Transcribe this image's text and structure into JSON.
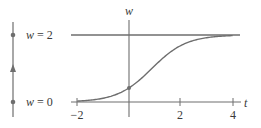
{
  "figure": {
    "phase_line": {
      "equilibria": [
        {
          "label_var": "w",
          "label_eq": " = ",
          "label_val": "2",
          "value": 2,
          "type": "sink"
        },
        {
          "label_var": "w",
          "label_eq": " = ",
          "label_val": "0",
          "value": 0,
          "type": "source"
        }
      ],
      "arrow_direction": "up"
    },
    "axes": {
      "x_label": "t",
      "y_label": "w",
      "x_ticks": [
        {
          "value": -2,
          "label": "−2"
        },
        {
          "value": 2,
          "label": "2"
        },
        {
          "value": 4,
          "label": "4"
        }
      ]
    },
    "colors": {
      "line": "#6e6e6e",
      "curve": "#6e6e6e",
      "text": "#3a3a3a"
    }
  },
  "chart_data": {
    "type": "line",
    "title": "",
    "xlabel": "t",
    "ylabel": "w",
    "xlim": [
      -2,
      4
    ],
    "ylim": [
      0,
      2
    ],
    "x_ticks": [
      -2,
      2,
      4
    ],
    "grid": false,
    "series": [
      {
        "name": "solution w(t)",
        "x": [
          -2,
          -1.5,
          -1,
          -0.5,
          0,
          0.5,
          1,
          1.5,
          2,
          2.5,
          3,
          3.5,
          4
        ],
        "values": [
          0.03,
          0.06,
          0.11,
          0.23,
          0.42,
          0.74,
          1.09,
          1.41,
          1.68,
          1.84,
          1.92,
          1.96,
          1.98
        ]
      },
      {
        "name": "equilibrium w = 2",
        "x": [
          -2,
          4
        ],
        "values": [
          2,
          2
        ]
      },
      {
        "name": "equilibrium w = 0",
        "x": [
          -2,
          4
        ],
        "values": [
          0,
          0
        ]
      }
    ],
    "annotations": [
      "w = 2",
      "w = 0",
      "phase line with upward arrow between equilibria"
    ]
  }
}
